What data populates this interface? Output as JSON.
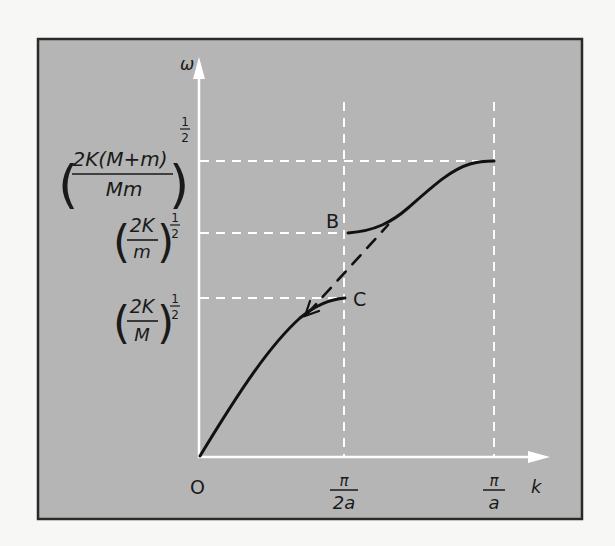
{
  "figure": {
    "type": "dispersion-relation-diatomic-chain",
    "colors": {
      "page_background": "#f7f7f5",
      "panel_background": "#b5b5b5",
      "panel_border": "#2a2a2a",
      "axes": "#ffffff",
      "guides": "#ffffff",
      "curve": "#111111",
      "text": "#1a1a1a"
    },
    "axes": {
      "y_label": "ω",
      "x_label": "k",
      "origin_label": "O"
    },
    "x_ticks": [
      {
        "num": "π",
        "den": "2a"
      },
      {
        "num": "π",
        "den": "a"
      }
    ],
    "y_levels": [
      {
        "name": "optical-top",
        "num": "2K(M+m)",
        "den": "Mm",
        "exponent": "1/2",
        "exp_num": "1",
        "exp_den": "2"
      },
      {
        "name": "optical-bottom",
        "num": "2K",
        "den": "m",
        "exponent": "1/2",
        "exp_num": "1",
        "exp_den": "2"
      },
      {
        "name": "acoustic-top",
        "num": "2K",
        "den": "M",
        "exponent": "1/2",
        "exp_num": "1",
        "exp_den": "2"
      }
    ],
    "point_labels": {
      "B": "B",
      "C": "C"
    },
    "curves": [
      {
        "name": "acoustic-branch",
        "from": "O",
        "to": "C"
      },
      {
        "name": "optical-branch",
        "from": "B",
        "to": "π/a"
      },
      {
        "name": "monatomic-extension",
        "style": "dashed",
        "from": "C",
        "to": "B"
      }
    ]
  }
}
